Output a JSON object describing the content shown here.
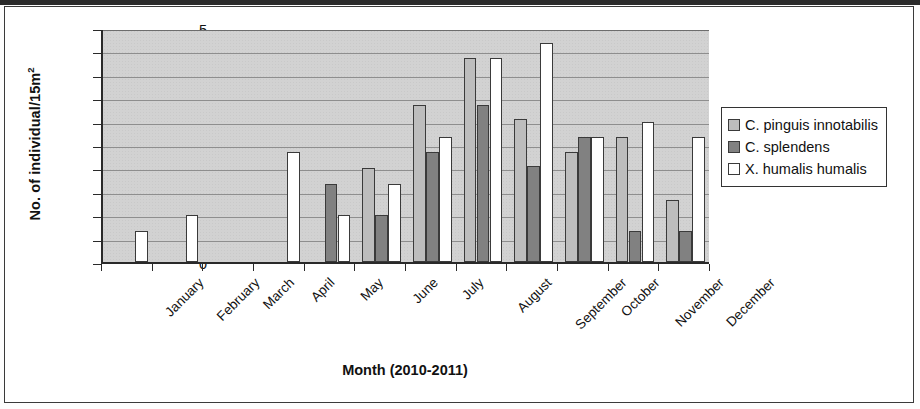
{
  "figure": {
    "ylabel_main": "No. of individual/15m",
    "ylabel_sup": "2",
    "xtitle": "Month (2010-2011)"
  },
  "legend": {
    "items": [
      {
        "label": "C. pinguis innotabilis",
        "color": "#bdbdbd"
      },
      {
        "label": "C. splendens",
        "color": "#818181"
      },
      {
        "label": "X. humalis humalis",
        "color": "#ffffff"
      }
    ]
  },
  "chart_data": {
    "type": "bar",
    "title": "",
    "xlabel": "Month (2010-2011)",
    "ylabel": "No. of individual/15m2",
    "ylim": [
      0,
      5
    ],
    "ytick_step": 0.5,
    "yticks": [
      "0",
      "0.5",
      "1",
      "1.5",
      "2",
      "2.5",
      "3",
      "3.5",
      "4",
      "4.5",
      "5"
    ],
    "grid": true,
    "legend_position": "right",
    "categories": [
      "January",
      "February",
      "March",
      "April",
      "May",
      "June",
      "July",
      "August",
      "September",
      "October",
      "November",
      "December"
    ],
    "series": [
      {
        "name": "C. pinguis innotabilis",
        "color": "#bdbdbd",
        "values": [
          0,
          0,
          0,
          0,
          0,
          2.0,
          3.35,
          4.35,
          3.05,
          2.35,
          2.67,
          1.33
        ]
      },
      {
        "name": "C. splendens",
        "color": "#818181",
        "values": [
          0,
          0,
          0,
          0,
          1.67,
          1.0,
          2.35,
          3.35,
          2.05,
          2.67,
          0.67,
          0.67
        ]
      },
      {
        "name": "X. humalis humalis",
        "color": "#ffffff",
        "values": [
          0.67,
          1.0,
          0,
          2.35,
          1.0,
          1.67,
          2.67,
          4.35,
          4.67,
          2.67,
          3.0,
          2.67
        ]
      }
    ]
  }
}
